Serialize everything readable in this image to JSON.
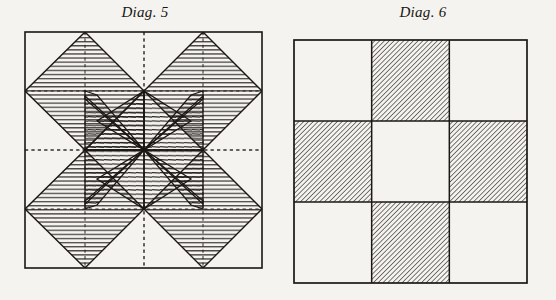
{
  "page": {
    "background_color": "#f5f3ef",
    "ink_color": "#1a1714",
    "width": 556,
    "height": 300
  },
  "figures": [
    {
      "id": "diag-5",
      "title": "Diag. 5",
      "title_x": 144,
      "title_y": 4,
      "frame": {
        "x": 25,
        "y": 32,
        "width": 237,
        "height": 236
      },
      "description": "Eight-pointed star / pinwheel patchwork block drawn in pen with diagonal line hatching; construction guide lines shown dashed.",
      "grid": {
        "style": "dashed",
        "vertical_lines": [
          85,
          144,
          203
        ],
        "horizontal_lines": [
          91,
          150,
          209
        ]
      },
      "hatch": {
        "spacing": 4.0,
        "stroke_width": 1.0,
        "angle_upper_left": 0,
        "note": "horizontal and near-horizontal line shading following each piece"
      },
      "shapes": [
        {
          "name": "corner-diamond-top-left",
          "kind": "hatched"
        },
        {
          "name": "corner-diamond-top-right",
          "kind": "hatched"
        },
        {
          "name": "corner-diamond-bottom-left",
          "kind": "hatched"
        },
        {
          "name": "corner-diamond-bottom-right",
          "kind": "hatched"
        },
        {
          "name": "pinwheel-blade-upper-left",
          "kind": "hatched"
        },
        {
          "name": "pinwheel-blade-upper-right",
          "kind": "hatched"
        },
        {
          "name": "pinwheel-blade-lower-left",
          "kind": "hatched"
        },
        {
          "name": "pinwheel-blade-lower-right",
          "kind": "hatched"
        },
        {
          "name": "center-field",
          "kind": "plain"
        }
      ]
    },
    {
      "id": "diag-6",
      "title": "Diag. 6",
      "title_x": 410,
      "title_y": 4,
      "frame": {
        "x": 294,
        "y": 40,
        "width": 233,
        "height": 243
      },
      "description": "Nine-patch block: a cross of four shaded squares at the centre of each side, with plain squares at the four corners and in the middle.",
      "grid": {
        "style": "solid",
        "rows": 3,
        "columns": 3
      },
      "hatch": {
        "spacing": 3.4,
        "stroke_width": 1.1,
        "angle": 45,
        "direction": "lower-left to upper-right"
      },
      "cells": [
        {
          "row": 0,
          "col": 0,
          "name": "cell-top-left",
          "shaded": false
        },
        {
          "row": 0,
          "col": 1,
          "name": "cell-top-middle",
          "shaded": true
        },
        {
          "row": 0,
          "col": 2,
          "name": "cell-top-right",
          "shaded": false
        },
        {
          "row": 1,
          "col": 0,
          "name": "cell-middle-left",
          "shaded": true
        },
        {
          "row": 1,
          "col": 1,
          "name": "cell-center",
          "shaded": false
        },
        {
          "row": 1,
          "col": 2,
          "name": "cell-middle-right",
          "shaded": true
        },
        {
          "row": 2,
          "col": 0,
          "name": "cell-bottom-left",
          "shaded": false
        },
        {
          "row": 2,
          "col": 1,
          "name": "cell-bottom-middle",
          "shaded": true
        },
        {
          "row": 2,
          "col": 2,
          "name": "cell-bottom-right",
          "shaded": false
        }
      ]
    }
  ],
  "plate": {
    "bottom_rule_visible": true,
    "left_rule_visible": true
  }
}
